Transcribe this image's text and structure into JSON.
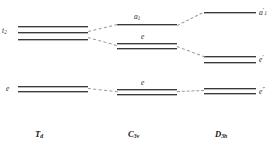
{
  "diagram": {
    "columns": [
      {
        "id": "td",
        "group_label": "T",
        "group_sub": "d",
        "levels": [
          {
            "name": "t2-level",
            "label": "t",
            "sub": "2",
            "sup": "",
            "lines": 3
          },
          {
            "name": "e-level",
            "label": "e",
            "sub": "",
            "sup": "",
            "lines": 2
          }
        ]
      },
      {
        "id": "c3v",
        "group_label": "C",
        "group_sub": "3v",
        "levels": [
          {
            "name": "a1-level",
            "label": "a",
            "sub": "1",
            "sup": "",
            "lines": 1
          },
          {
            "name": "e-upper-level",
            "label": "e",
            "sub": "",
            "sup": "",
            "lines": 2
          },
          {
            "name": "e-lower-level",
            "label": "e",
            "sub": "",
            "sup": "",
            "lines": 2
          }
        ]
      },
      {
        "id": "d3h",
        "group_label": "D",
        "group_sub": "3h",
        "levels": [
          {
            "name": "a1-prime-level",
            "label": "a",
            "sub": "1",
            "sup": "′",
            "lines": 1
          },
          {
            "name": "e-prime-level",
            "label": "e",
            "sub": "",
            "sup": "′",
            "lines": 2
          },
          {
            "name": "e-doubleprime-level",
            "label": "e",
            "sub": "",
            "sup": "″",
            "lines": 2
          }
        ]
      }
    ]
  }
}
